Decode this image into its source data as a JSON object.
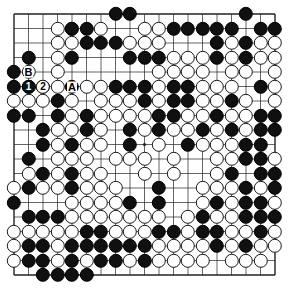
{
  "board": {
    "name": "go-board",
    "size": 19,
    "origin_x": 14,
    "origin_y": 14,
    "spacing": 14.5,
    "stone_radius": 7.2,
    "line_color": "#222222",
    "border_color": "#000000",
    "background_color": "#ffffff",
    "black_color": "#101010",
    "white_color": "#ffffff",
    "star_points": [
      [
        4,
        4
      ],
      [
        10,
        4
      ],
      [
        16,
        4
      ],
      [
        4,
        10
      ],
      [
        10,
        10
      ],
      [
        16,
        10
      ],
      [
        4,
        16
      ],
      [
        10,
        16
      ],
      [
        16,
        16
      ]
    ],
    "black_stones": [
      [
        8,
        1
      ],
      [
        9,
        1
      ],
      [
        17,
        1
      ],
      [
        5,
        2
      ],
      [
        6,
        2
      ],
      [
        12,
        2
      ],
      [
        13,
        2
      ],
      [
        14,
        2
      ],
      [
        15,
        2
      ],
      [
        16,
        2
      ],
      [
        18,
        2
      ],
      [
        19,
        2
      ],
      [
        6,
        3
      ],
      [
        7,
        3
      ],
      [
        8,
        3
      ],
      [
        15,
        3
      ],
      [
        17,
        3
      ],
      [
        2,
        4
      ],
      [
        5,
        4
      ],
      [
        9,
        4
      ],
      [
        10,
        4
      ],
      [
        11,
        4
      ],
      [
        15,
        4
      ],
      [
        17,
        4
      ],
      [
        1,
        5
      ],
      [
        1,
        6
      ],
      [
        3,
        6
      ],
      [
        5,
        6
      ],
      [
        8,
        6
      ],
      [
        9,
        6
      ],
      [
        10,
        6
      ],
      [
        12,
        6
      ],
      [
        13,
        6
      ],
      [
        18,
        6
      ],
      [
        4,
        7
      ],
      [
        10,
        7
      ],
      [
        12,
        7
      ],
      [
        13,
        7
      ],
      [
        16,
        7
      ],
      [
        1,
        8
      ],
      [
        2,
        8
      ],
      [
        4,
        8
      ],
      [
        6,
        8
      ],
      [
        11,
        8
      ],
      [
        12,
        8
      ],
      [
        15,
        8
      ],
      [
        18,
        8
      ],
      [
        19,
        8
      ],
      [
        3,
        9
      ],
      [
        6,
        9
      ],
      [
        9,
        9
      ],
      [
        11,
        9
      ],
      [
        14,
        9
      ],
      [
        16,
        9
      ],
      [
        18,
        9
      ],
      [
        19,
        9
      ],
      [
        3,
        10
      ],
      [
        5,
        10
      ],
      [
        9,
        10
      ],
      [
        13,
        10
      ],
      [
        17,
        10
      ],
      [
        18,
        10
      ],
      [
        2,
        11
      ],
      [
        17,
        11
      ],
      [
        18,
        11
      ],
      [
        3,
        12
      ],
      [
        5,
        12
      ],
      [
        16,
        12
      ],
      [
        18,
        12
      ],
      [
        19,
        12
      ],
      [
        2,
        13
      ],
      [
        5,
        13
      ],
      [
        11,
        13
      ],
      [
        17,
        13
      ],
      [
        19,
        13
      ],
      [
        1,
        14
      ],
      [
        9,
        14
      ],
      [
        11,
        14
      ],
      [
        15,
        14
      ],
      [
        17,
        14
      ],
      [
        18,
        14
      ],
      [
        2,
        15
      ],
      [
        3,
        15
      ],
      [
        4,
        15
      ],
      [
        14,
        15
      ],
      [
        17,
        15
      ],
      [
        18,
        15
      ],
      [
        19,
        15
      ],
      [
        6,
        16
      ],
      [
        7,
        16
      ],
      [
        11,
        16
      ],
      [
        12,
        16
      ],
      [
        14,
        16
      ],
      [
        15,
        16
      ],
      [
        18,
        16
      ],
      [
        2,
        17
      ],
      [
        3,
        17
      ],
      [
        5,
        17
      ],
      [
        6,
        17
      ],
      [
        7,
        17
      ],
      [
        8,
        17
      ],
      [
        9,
        17
      ],
      [
        10,
        17
      ],
      [
        15,
        17
      ],
      [
        17,
        17
      ],
      [
        2,
        18
      ],
      [
        3,
        18
      ],
      [
        5,
        18
      ],
      [
        7,
        18
      ],
      [
        8,
        18
      ],
      [
        10,
        18
      ],
      [
        3,
        19
      ],
      [
        4,
        19
      ],
      [
        5,
        19
      ],
      [
        6,
        19
      ]
    ],
    "white_stones": [
      [
        4,
        2
      ],
      [
        5,
        2
      ],
      [
        7,
        2
      ],
      [
        10,
        2
      ],
      [
        11,
        2
      ],
      [
        4,
        3
      ],
      [
        5,
        3
      ],
      [
        9,
        3
      ],
      [
        10,
        3
      ],
      [
        11,
        3
      ],
      [
        16,
        3
      ],
      [
        18,
        3
      ],
      [
        19,
        3
      ],
      [
        4,
        4
      ],
      [
        12,
        4
      ],
      [
        13,
        4
      ],
      [
        14,
        4
      ],
      [
        16,
        4
      ],
      [
        18,
        4
      ],
      [
        19,
        4
      ],
      [
        2,
        5
      ],
      [
        4,
        5
      ],
      [
        11,
        5
      ],
      [
        12,
        5
      ],
      [
        13,
        5
      ],
      [
        14,
        5
      ],
      [
        16,
        5
      ],
      [
        17,
        5
      ],
      [
        19,
        5
      ],
      [
        2,
        6
      ],
      [
        4,
        6
      ],
      [
        6,
        6
      ],
      [
        7,
        6
      ],
      [
        11,
        6
      ],
      [
        14,
        6
      ],
      [
        15,
        6
      ],
      [
        16,
        6
      ],
      [
        19,
        6
      ],
      [
        1,
        7
      ],
      [
        2,
        7
      ],
      [
        3,
        7
      ],
      [
        5,
        7
      ],
      [
        7,
        7
      ],
      [
        8,
        7
      ],
      [
        9,
        7
      ],
      [
        11,
        7
      ],
      [
        14,
        7
      ],
      [
        15,
        7
      ],
      [
        17,
        7
      ],
      [
        19,
        7
      ],
      [
        5,
        8
      ],
      [
        7,
        8
      ],
      [
        8,
        8
      ],
      [
        9,
        8
      ],
      [
        10,
        8
      ],
      [
        13,
        8
      ],
      [
        14,
        8
      ],
      [
        16,
        8
      ],
      [
        17,
        8
      ],
      [
        4,
        9
      ],
      [
        5,
        9
      ],
      [
        7,
        9
      ],
      [
        10,
        9
      ],
      [
        12,
        9
      ],
      [
        13,
        9
      ],
      [
        15,
        9
      ],
      [
        17,
        9
      ],
      [
        4,
        10
      ],
      [
        6,
        10
      ],
      [
        7,
        10
      ],
      [
        11,
        10
      ],
      [
        14,
        10
      ],
      [
        15,
        10
      ],
      [
        16,
        10
      ],
      [
        4,
        11
      ],
      [
        5,
        11
      ],
      [
        6,
        11
      ],
      [
        8,
        11
      ],
      [
        9,
        11
      ],
      [
        10,
        11
      ],
      [
        12,
        11
      ],
      [
        15,
        11
      ],
      [
        16,
        11
      ],
      [
        19,
        11
      ],
      [
        2,
        12
      ],
      [
        4,
        12
      ],
      [
        6,
        12
      ],
      [
        7,
        12
      ],
      [
        10,
        12
      ],
      [
        12,
        12
      ],
      [
        15,
        12
      ],
      [
        1,
        13
      ],
      [
        3,
        13
      ],
      [
        4,
        13
      ],
      [
        6,
        13
      ],
      [
        7,
        13
      ],
      [
        8,
        13
      ],
      [
        14,
        13
      ],
      [
        15,
        13
      ],
      [
        16,
        13
      ],
      [
        18,
        13
      ],
      [
        5,
        14
      ],
      [
        6,
        14
      ],
      [
        7,
        14
      ],
      [
        8,
        14
      ],
      [
        14,
        14
      ],
      [
        16,
        14
      ],
      [
        19,
        14
      ],
      [
        5,
        15
      ],
      [
        6,
        15
      ],
      [
        7,
        15
      ],
      [
        8,
        15
      ],
      [
        9,
        15
      ],
      [
        10,
        15
      ],
      [
        11,
        15
      ],
      [
        13,
        15
      ],
      [
        15,
        15
      ],
      [
        16,
        15
      ],
      [
        1,
        16
      ],
      [
        2,
        16
      ],
      [
        3,
        16
      ],
      [
        4,
        16
      ],
      [
        5,
        16
      ],
      [
        8,
        16
      ],
      [
        9,
        16
      ],
      [
        10,
        16
      ],
      [
        13,
        16
      ],
      [
        16,
        16
      ],
      [
        17,
        16
      ],
      [
        19,
        16
      ],
      [
        1,
        17
      ],
      [
        4,
        17
      ],
      [
        11,
        17
      ],
      [
        12,
        17
      ],
      [
        13,
        17
      ],
      [
        14,
        17
      ],
      [
        16,
        17
      ],
      [
        18,
        17
      ],
      [
        19,
        17
      ],
      [
        1,
        18
      ],
      [
        4,
        18
      ],
      [
        6,
        18
      ],
      [
        9,
        18
      ],
      [
        11,
        18
      ],
      [
        12,
        18
      ],
      [
        13,
        18
      ],
      [
        14,
        18
      ],
      [
        16,
        18
      ],
      [
        17,
        18
      ],
      [
        18,
        18
      ]
    ],
    "numbered_stones": [
      {
        "label": "1",
        "col": 2,
        "row": 6,
        "color": "black"
      },
      {
        "label": "2",
        "col": 3,
        "row": 6,
        "color": "white"
      }
    ],
    "point_labels": [
      {
        "label": "B",
        "col": 2,
        "row": 5
      },
      {
        "label": "A",
        "col": 5,
        "row": 6
      }
    ]
  }
}
